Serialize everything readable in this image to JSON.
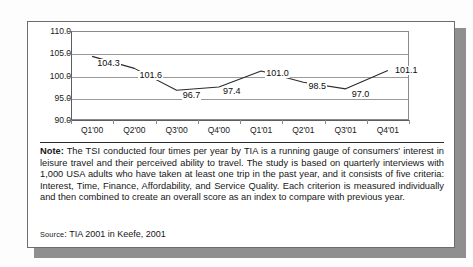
{
  "figure": {
    "note_label": "Note:",
    "note_body": " The TSI  conducted four times per year by TIA is a running gauge of consumers' interest in leisure travel and their perceived ability to travel. The study is based on quarterly interviews with 1,000 USA adults who have taken at least one trip in the past year, and it consists of five criteria: Interest, Time, Finance, Affordability, and Service Quality. Each criterion is measured individually and then combined to create an overall score as an index to compare with previous year.",
    "source_label": "Source",
    "source_sep": ": ",
    "source_text": "TIA 2001 in Keefe, 2001"
  },
  "chart_data": {
    "type": "line",
    "title": "",
    "xlabel": "",
    "ylabel": "",
    "categories": [
      "Q1'00",
      "Q2'00",
      "Q3'00",
      "Q4'00",
      "Q1'01",
      "Q2'01",
      "Q3'01",
      "Q4'01"
    ],
    "values": [
      104.3,
      101.6,
      96.7,
      97.4,
      101.0,
      98.5,
      97.0,
      101.1
    ],
    "data_labels": [
      "104.3",
      "101.6",
      "96.7",
      "97.4",
      "101.0",
      "98.5",
      "97.0",
      "101.1"
    ],
    "ylim": [
      90.0,
      110.0
    ],
    "yticks": [
      110.0,
      105.0,
      100.0,
      95.0,
      90.0
    ],
    "ytick_labels": [
      "110.0",
      "105.0",
      "100.0",
      "95.0",
      "90.0"
    ],
    "grid": true,
    "legend": "none",
    "series_color": "#2b2b2b"
  }
}
